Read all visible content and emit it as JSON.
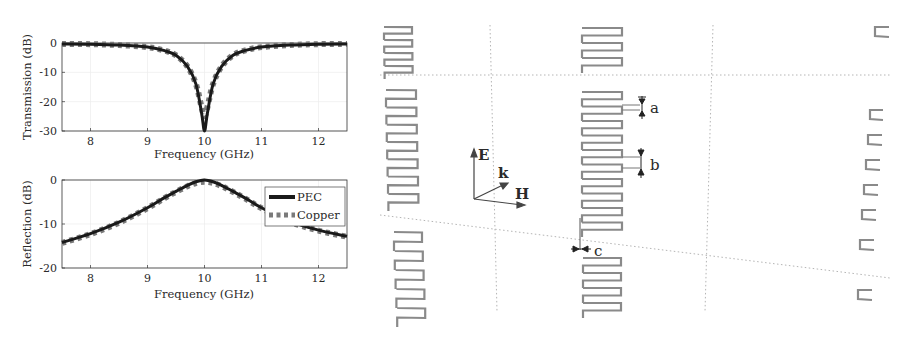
{
  "figure": {
    "left_title": "Transmission and reflection spectra",
    "right_title": "Meander-line metasurface unit cells"
  },
  "chart_data": [
    {
      "type": "line",
      "title": "",
      "xlabel": "Frequency (GHz)",
      "ylabel": "Transmission (dB)",
      "xlim": [
        7.5,
        12.5
      ],
      "ylim": [
        -30,
        0
      ],
      "xticks": [
        "8",
        "9",
        "10",
        "11",
        "12"
      ],
      "yticks": [
        "0",
        "-10",
        "-20",
        "-30"
      ],
      "grid": true,
      "legend": "none",
      "x": [
        7.5,
        8.0,
        8.5,
        9.0,
        9.3,
        9.5,
        9.7,
        9.85,
        9.95,
        10.0,
        10.05,
        10.15,
        10.3,
        10.5,
        10.7,
        11.0,
        11.5,
        12.0,
        12.5
      ],
      "series": [
        {
          "name": "PEC",
          "values": [
            -0.3,
            -0.4,
            -0.7,
            -1.4,
            -2.6,
            -4.2,
            -8.0,
            -14.0,
            -24.0,
            -30.0,
            -24.0,
            -14.0,
            -8.0,
            -4.2,
            -2.6,
            -1.4,
            -0.7,
            -0.4,
            -0.3
          ]
        },
        {
          "name": "Copper",
          "values": [
            -0.3,
            -0.4,
            -0.7,
            -1.4,
            -2.6,
            -4.2,
            -8.0,
            -14.0,
            -22.0,
            -25.0,
            -22.0,
            -14.0,
            -8.0,
            -4.2,
            -2.6,
            -1.4,
            -0.7,
            -0.4,
            -0.3
          ]
        }
      ]
    },
    {
      "type": "line",
      "title": "",
      "xlabel": "Frequency (GHz)",
      "ylabel": "Reflection (dB)",
      "xlim": [
        7.5,
        12.5
      ],
      "ylim": [
        -20,
        0
      ],
      "xticks": [
        "8",
        "9",
        "10",
        "11",
        "12"
      ],
      "yticks": [
        "0",
        "-10",
        "-20"
      ],
      "grid": true,
      "legend": "upper right",
      "x": [
        7.5,
        8.0,
        8.5,
        9.0,
        9.3,
        9.5,
        9.7,
        9.85,
        10.0,
        10.15,
        10.3,
        10.5,
        10.7,
        11.0,
        11.5,
        12.0,
        12.5
      ],
      "series": [
        {
          "name": "PEC",
          "values": [
            -14.2,
            -12.2,
            -9.6,
            -6.3,
            -4.0,
            -2.6,
            -1.2,
            -0.4,
            0.0,
            -0.4,
            -1.2,
            -2.6,
            -4.0,
            -6.3,
            -9.4,
            -11.4,
            -12.8
          ]
        },
        {
          "name": "Copper",
          "values": [
            -14.3,
            -12.3,
            -9.7,
            -6.4,
            -4.1,
            -2.7,
            -1.4,
            -0.7,
            -0.4,
            -0.7,
            -1.4,
            -2.7,
            -4.1,
            -6.4,
            -9.5,
            -11.5,
            -12.9
          ]
        }
      ]
    }
  ],
  "legend": {
    "items": [
      {
        "label": "PEC",
        "style": "solid",
        "color": "#1a1a1a"
      },
      {
        "label": "Copper",
        "style": "dashed",
        "color": "#7a7a7a"
      }
    ]
  },
  "diagram": {
    "field_labels": {
      "e": "E",
      "k": "k",
      "h": "H"
    },
    "dimension_labels": {
      "a": "a",
      "b": "b",
      "c": "c"
    }
  },
  "colors": {
    "pec_line": "#1a1a1a",
    "copper_line": "#7a7a7a",
    "meander": "#8a8a8a",
    "grid_dotted": "#b5b5b5",
    "axis": "#333333"
  }
}
